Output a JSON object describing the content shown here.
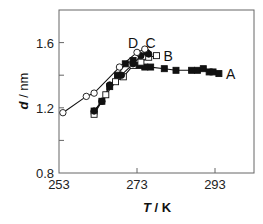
{
  "chart_data": {
    "type": "line",
    "title": "",
    "xlabel": "T / K",
    "ylabel": "d / nm",
    "xlim": [
      253,
      303
    ],
    "ylim": [
      0.8,
      1.8
    ],
    "x_ticks": [
      253,
      273,
      293
    ],
    "x_tick_labels": [
      "253",
      "273",
      "293"
    ],
    "y_ticks": [
      0.8,
      1.2,
      1.6
    ],
    "y_tick_labels": [
      "0.8",
      "1.2",
      "1.6"
    ],
    "y_minor_ticks": [
      1.0,
      1.4
    ],
    "grid": false,
    "legend": "inline labels near line ends",
    "series": [
      {
        "name": "A",
        "marker": "filled-square",
        "x": [
          262.0,
          264.0,
          266.0,
          268.0,
          270.0,
          272.0,
          273.5,
          275.0,
          276.5,
          280.0,
          283.0,
          287.0,
          288.5,
          290.0,
          291.5,
          292.5,
          294.0
        ],
        "y": [
          1.18,
          1.24,
          1.33,
          1.4,
          1.47,
          1.49,
          1.46,
          1.45,
          1.45,
          1.44,
          1.43,
          1.43,
          1.43,
          1.44,
          1.42,
          1.42,
          1.41
        ]
      },
      {
        "name": "B",
        "marker": "open-square",
        "x": [
          262.0,
          265.0,
          267.5,
          269.5,
          272.0,
          274.0,
          276.0,
          278.0
        ],
        "y": [
          1.16,
          1.28,
          1.36,
          1.39,
          1.46,
          1.48,
          1.51,
          1.52
        ]
      },
      {
        "name": "C",
        "marker": "filled-circle",
        "x": [
          262.0,
          264.0,
          266.0,
          269.0,
          272.0,
          274.0,
          275.5,
          276.0
        ],
        "y": [
          1.18,
          1.24,
          1.34,
          1.4,
          1.47,
          1.52,
          1.54,
          1.53
        ]
      },
      {
        "name": "D",
        "marker": "open-circle",
        "x": [
          254.0,
          260.0,
          262.0,
          268.5,
          273.0,
          275.0
        ],
        "y": [
          1.17,
          1.27,
          1.29,
          1.45,
          1.54,
          1.56
        ]
      }
    ],
    "annotations": [
      {
        "text": "A",
        "x": 297.0,
        "y": 1.41
      },
      {
        "text": "B",
        "x": 281.0,
        "y": 1.52
      },
      {
        "text": "C",
        "x": 276.5,
        "y": 1.6
      },
      {
        "text": "D",
        "x": 272.0,
        "y": 1.6
      }
    ]
  },
  "axis": {
    "x_title_italic": "T",
    "x_title_rest": " / K",
    "y_title_italic": "d",
    "y_title_rest": " / nm"
  },
  "colors": {
    "line": "#111111",
    "frame": "#555555",
    "marker_fill": "#111111",
    "open_fill": "#ffffff"
  }
}
